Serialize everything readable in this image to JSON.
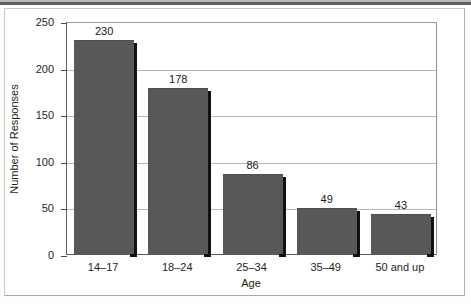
{
  "chart_data": {
    "type": "bar",
    "title": "",
    "xlabel": "Age",
    "ylabel": "Number of Responses",
    "categories": [
      "14–17",
      "18–24",
      "25–34",
      "35–49",
      "50 and up"
    ],
    "values": [
      230,
      178,
      86,
      49,
      43
    ],
    "data_labels": [
      "230",
      "178",
      "86",
      "49",
      "43"
    ],
    "ylim": [
      0,
      250
    ],
    "yticks": [
      0,
      50,
      100,
      150,
      200,
      250
    ],
    "ytick_labels": [
      "0",
      "50",
      "100",
      "150",
      "200",
      "250"
    ],
    "grid": "horizontal",
    "legend": "none",
    "colors": {
      "bar_fill": "#585858",
      "bar_shadow": "#121212",
      "gridline": "#b4b6b8",
      "axis": "#5a5c5e",
      "text": "#1d1f20",
      "background": "#ffffff"
    }
  }
}
